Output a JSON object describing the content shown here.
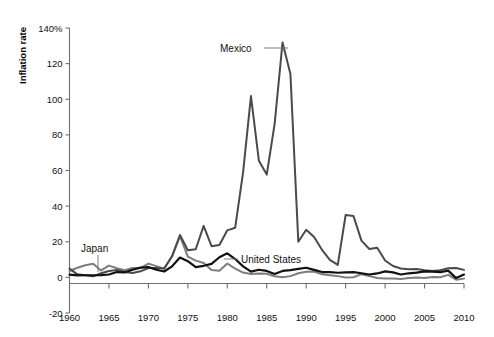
{
  "chart_data": {
    "type": "line",
    "title": "",
    "xlabel": "",
    "ylabel": "Inflation rate",
    "xlim": [
      1960,
      2010
    ],
    "ylim": [
      -20,
      140
    ],
    "grid": false,
    "legend_position": "inline-annotations",
    "x_ticks": [
      "1960",
      "1965",
      "1970",
      "1975",
      "1980",
      "1985",
      "1990",
      "1995",
      "2000",
      "2005",
      "2010"
    ],
    "y_ticks": [
      "140%",
      "120",
      "100",
      "80",
      "60",
      "40",
      "20",
      "0",
      "-20"
    ],
    "x": [
      1960,
      1961,
      1962,
      1963,
      1964,
      1965,
      1966,
      1967,
      1968,
      1969,
      1970,
      1971,
      1972,
      1973,
      1974,
      1975,
      1976,
      1977,
      1978,
      1979,
      1980,
      1981,
      1982,
      1983,
      1984,
      1985,
      1986,
      1987,
      1988,
      1989,
      1990,
      1991,
      1992,
      1993,
      1994,
      1995,
      1996,
      1997,
      1998,
      1999,
      2000,
      2001,
      2002,
      2003,
      2004,
      2005,
      2006,
      2007,
      2008,
      2009,
      2010
    ],
    "series": [
      {
        "name": "Mexico",
        "color": "#4a4a4a",
        "values": [
          4.9,
          1.7,
          1.2,
          0.6,
          2.3,
          3.6,
          4.2,
          3.0,
          2.4,
          3.4,
          5.2,
          5.3,
          5.0,
          12.0,
          23.8,
          15.2,
          15.8,
          28.9,
          17.5,
          18.2,
          26.4,
          27.9,
          58.9,
          101.8,
          65.5,
          57.7,
          86.2,
          131.8,
          114.2,
          20.0,
          26.7,
          22.7,
          15.5,
          9.8,
          7.0,
          35.0,
          34.4,
          20.6,
          15.9,
          16.6,
          9.5,
          6.4,
          5.0,
          4.5,
          4.7,
          4.0,
          3.6,
          4.0,
          5.1,
          5.3,
          4.2
        ]
      },
      {
        "name": "Japan",
        "color": "#7d7d7d",
        "values": [
          3.6,
          5.4,
          6.8,
          7.6,
          3.9,
          6.6,
          5.1,
          4.0,
          5.3,
          5.2,
          7.7,
          6.3,
          4.9,
          11.7,
          23.2,
          11.7,
          9.4,
          8.1,
          4.2,
          3.7,
          7.8,
          4.9,
          2.7,
          1.9,
          2.2,
          2.0,
          0.6,
          0.1,
          0.7,
          2.3,
          3.1,
          3.3,
          1.7,
          1.2,
          0.7,
          -0.1,
          0.1,
          1.8,
          0.7,
          -0.3,
          -0.7,
          -0.7,
          -0.9,
          -0.3,
          0.0,
          -0.3,
          0.2,
          0.1,
          1.4,
          -1.3,
          -0.7
        ]
      },
      {
        "name": "United States",
        "color": "#111111",
        "values": [
          1.5,
          1.1,
          1.2,
          1.2,
          1.3,
          1.6,
          3.0,
          2.8,
          4.3,
          5.5,
          5.8,
          4.3,
          3.3,
          6.2,
          11.1,
          9.1,
          5.8,
          6.5,
          7.6,
          11.3,
          13.5,
          10.3,
          6.2,
          3.2,
          4.3,
          3.6,
          1.9,
          3.6,
          4.1,
          4.8,
          5.4,
          4.2,
          3.0,
          3.0,
          2.6,
          2.8,
          2.9,
          2.3,
          1.6,
          2.2,
          3.4,
          2.8,
          1.6,
          2.3,
          2.7,
          3.4,
          3.2,
          2.9,
          3.8,
          -0.4,
          1.6
        ]
      }
    ],
    "annotations": [
      {
        "text": "Mexico",
        "series": "Mexico",
        "x": 1985,
        "y": 132
      },
      {
        "text": "Japan",
        "series": "Japan",
        "x": 1963,
        "y": 7.6
      },
      {
        "text": "United States",
        "series": "United States",
        "x": 1981,
        "y": 10.3
      }
    ]
  },
  "axis": {
    "y_title": "Inflation rate"
  },
  "labels": {
    "mexico": "Mexico",
    "japan": "Japan",
    "united_states": "United States"
  },
  "ticks": {
    "y": [
      "140%",
      "120",
      "100",
      "80",
      "60",
      "40",
      "20",
      "0",
      "-20"
    ],
    "x": [
      "1960",
      "1965",
      "1970",
      "1975",
      "1980",
      "1985",
      "1990",
      "1995",
      "2000",
      "2005",
      "2010"
    ]
  },
  "colors": {
    "mexico": "#4a4a4a",
    "japan": "#7d7d7d",
    "united_states": "#111111",
    "axis": "#6f6f6f"
  }
}
